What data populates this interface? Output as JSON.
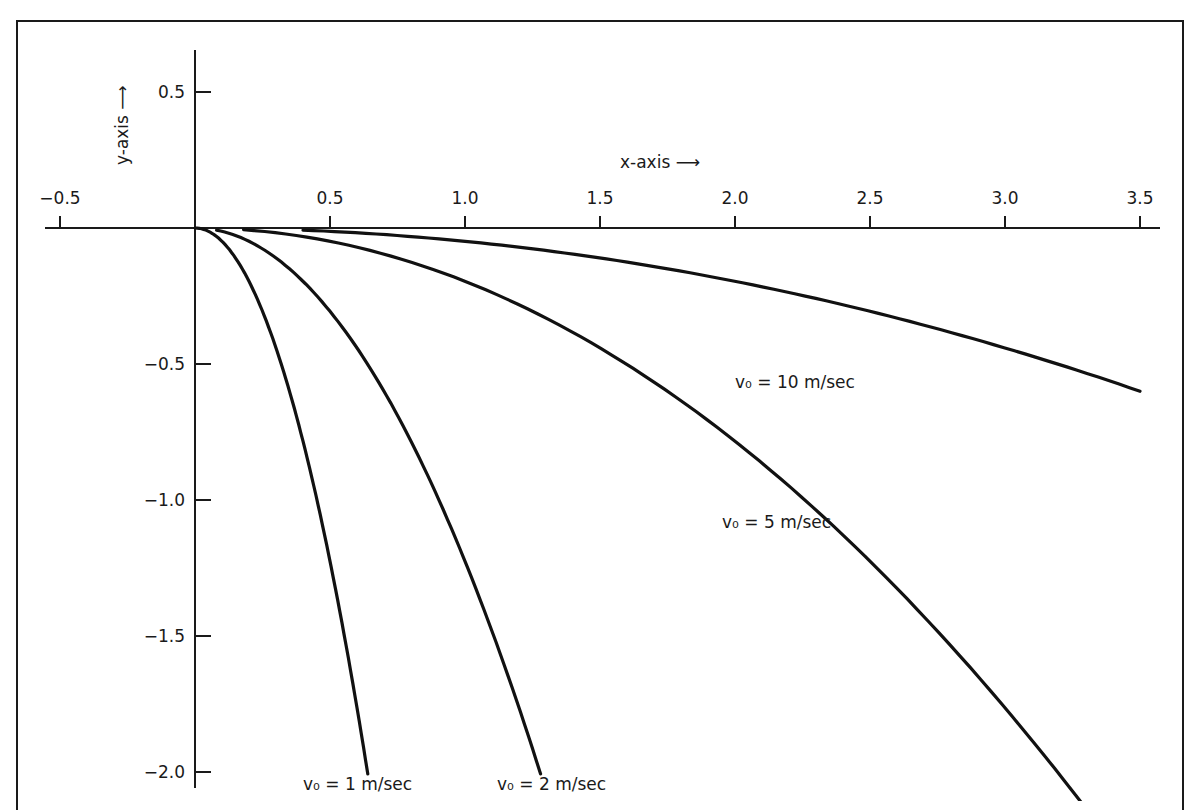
{
  "chart_data": {
    "type": "line",
    "title": "",
    "xlabel": "x-axis →",
    "ylabel": "y-axis →",
    "xlim": [
      -0.55,
      3.55
    ],
    "ylim": [
      -2.05,
      0.6
    ],
    "grid": false,
    "x_ticks": [
      -0.5,
      0.5,
      1.0,
      1.5,
      2.0,
      2.5,
      3.0,
      3.5
    ],
    "x_tick_labels": [
      "−0.5",
      "0.5",
      "1.0",
      "1.5",
      "2.0",
      "2.5",
      "3.0",
      "3.5"
    ],
    "y_ticks": [
      0.5,
      -0.5,
      -1.0,
      -1.5,
      -2.0
    ],
    "y_tick_labels": [
      "0.5",
      "−0.5",
      "−1.0",
      "−1.5",
      "−2.0"
    ],
    "series": [
      {
        "name": "v0 = 1 m/sec",
        "v0": 1,
        "label": "v₀ = 1 m/sec",
        "x": [
          0,
          0.1,
          0.2,
          0.3,
          0.4,
          0.5,
          0.6,
          0.64
        ],
        "y": [
          0,
          -0.05,
          -0.2,
          -0.44,
          -0.78,
          -1.23,
          -1.76,
          -2.0
        ]
      },
      {
        "name": "v0 = 2 m/sec",
        "v0": 2,
        "label": "v₀ = 2 m/sec",
        "x": [
          0,
          0.2,
          0.4,
          0.6,
          0.8,
          1.0,
          1.2,
          1.28
        ],
        "y": [
          0,
          -0.05,
          -0.2,
          -0.44,
          -0.78,
          -1.23,
          -1.76,
          -2.0
        ]
      },
      {
        "name": "v0 = 5 m/sec",
        "v0": 5,
        "label": "v₀ = 5 m/sec",
        "x": [
          0,
          0.5,
          1.0,
          1.5,
          2.0,
          2.5,
          3.0,
          3.3
        ],
        "y": [
          0,
          -0.05,
          -0.2,
          -0.44,
          -0.78,
          -1.23,
          -1.76,
          -2.0
        ]
      },
      {
        "name": "v0 = 10 m/sec",
        "v0": 10,
        "label": "v₀ = 10 m/sec",
        "x": [
          0,
          0.5,
          1.0,
          1.5,
          2.0,
          2.5,
          3.0,
          3.5
        ],
        "y": [
          0,
          -0.01,
          -0.05,
          -0.11,
          -0.2,
          -0.31,
          -0.44,
          -0.6
        ]
      }
    ],
    "annotations": [
      {
        "text": "v₀ = 1 m/sec",
        "x": 0.6,
        "y": -2.05
      },
      {
        "text": "v₀ = 2 m/sec",
        "x": 1.25,
        "y": -2.05
      },
      {
        "text": "v₀ = 5 m/sec",
        "x": 2.0,
        "y": -1.1
      },
      {
        "text": "v₀ = 10 m/sec",
        "x": 2.2,
        "y": -0.5
      }
    ]
  },
  "labels": {
    "x_axis": "x-axis ⟶",
    "y_axis": "y-axis ⟶"
  }
}
